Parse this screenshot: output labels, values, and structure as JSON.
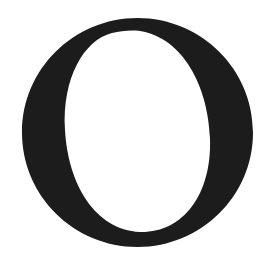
{
  "glyph": {
    "character": "O",
    "color": "#1c1c1c",
    "background": "#ffffff"
  }
}
